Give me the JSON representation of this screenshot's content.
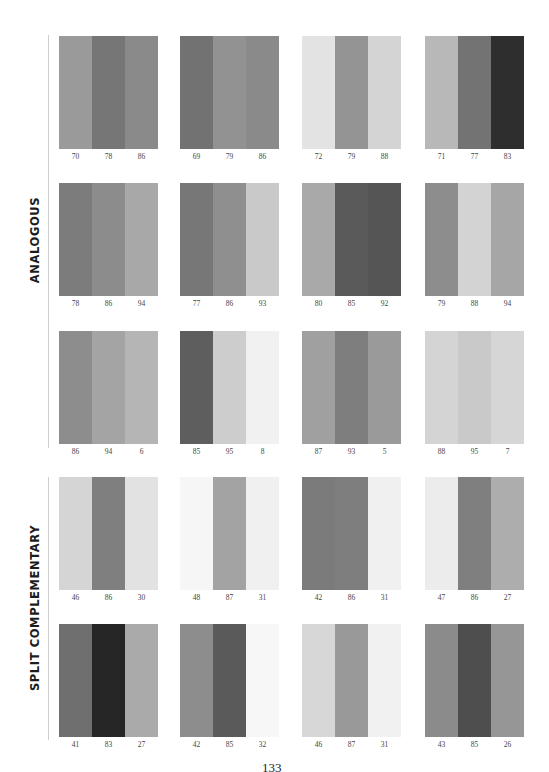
{
  "sections": [
    {
      "label": "ANALOGOUS",
      "line_top": 35,
      "line_height": 413,
      "label_center_y": 240
    },
    {
      "label": "SPLIT COMPLEMENTARY",
      "line_top": 477,
      "line_height": 263,
      "label_center_y": 608
    }
  ],
  "layout": {
    "columns_x": [
      59,
      180,
      302,
      425
    ],
    "rows_y": [
      36,
      183,
      331,
      477,
      624
    ]
  },
  "swatches": [
    {
      "section": "ANALOGOUS",
      "row": 0,
      "col": 0,
      "values": [
        "70",
        "78",
        "86"
      ],
      "colors": [
        "#9a9a9a",
        "#767676",
        "#8a8a8a"
      ]
    },
    {
      "section": "ANALOGOUS",
      "row": 0,
      "col": 1,
      "values": [
        "69",
        "79",
        "86"
      ],
      "colors": [
        "#727272",
        "#929292",
        "#8a8a8a"
      ]
    },
    {
      "section": "ANALOGOUS",
      "row": 0,
      "col": 2,
      "values": [
        "72",
        "79",
        "88"
      ],
      "colors": [
        "#e3e3e3",
        "#949494",
        "#d4d4d4"
      ]
    },
    {
      "section": "ANALOGOUS",
      "row": 0,
      "col": 3,
      "values": [
        "71",
        "77",
        "83"
      ],
      "colors": [
        "#b8b8b8",
        "#737373",
        "#2e2e2e"
      ]
    },
    {
      "section": "ANALOGOUS",
      "row": 1,
      "col": 0,
      "values": [
        "78",
        "86",
        "94"
      ],
      "colors": [
        "#7c7c7c",
        "#8c8c8c",
        "#a8a8a8"
      ]
    },
    {
      "section": "ANALOGOUS",
      "row": 1,
      "col": 1,
      "values": [
        "77",
        "86",
        "93"
      ],
      "colors": [
        "#777777",
        "#8f8f8f",
        "#c9c9c9"
      ]
    },
    {
      "section": "ANALOGOUS",
      "row": 1,
      "col": 2,
      "values": [
        "80",
        "85",
        "92"
      ],
      "colors": [
        "#a9a9a9",
        "#5a5a5a",
        "#555555"
      ]
    },
    {
      "section": "ANALOGOUS",
      "row": 1,
      "col": 3,
      "values": [
        "79",
        "88",
        "94"
      ],
      "colors": [
        "#8d8d8d",
        "#d3d3d3",
        "#a6a6a6"
      ]
    },
    {
      "section": "ANALOGOUS",
      "row": 2,
      "col": 0,
      "values": [
        "86",
        "94",
        "6"
      ],
      "colors": [
        "#8d8d8d",
        "#a4a4a4",
        "#b5b5b5"
      ]
    },
    {
      "section": "ANALOGOUS",
      "row": 2,
      "col": 1,
      "values": [
        "85",
        "95",
        "8"
      ],
      "colors": [
        "#5e5e5e",
        "#cdcdcd",
        "#f1f1f1"
      ]
    },
    {
      "section": "ANALOGOUS",
      "row": 2,
      "col": 2,
      "values": [
        "87",
        "93",
        "5"
      ],
      "colors": [
        "#a0a0a0",
        "#7e7e7e",
        "#9a9a9a"
      ]
    },
    {
      "section": "ANALOGOUS",
      "row": 2,
      "col": 3,
      "values": [
        "88",
        "95",
        "7"
      ],
      "colors": [
        "#d4d4d4",
        "#c9c9c9",
        "#d6d6d6"
      ]
    },
    {
      "section": "SPLIT COMPLEMENTARY",
      "row": 3,
      "col": 0,
      "values": [
        "46",
        "86",
        "30"
      ],
      "colors": [
        "#d5d5d5",
        "#7f7f7f",
        "#e2e2e2"
      ]
    },
    {
      "section": "SPLIT COMPLEMENTARY",
      "row": 3,
      "col": 1,
      "values": [
        "48",
        "87",
        "31"
      ],
      "colors": [
        "#f6f6f6",
        "#a3a3a3",
        "#f0f0f0"
      ]
    },
    {
      "section": "SPLIT COMPLEMENTARY",
      "row": 3,
      "col": 2,
      "values": [
        "42",
        "86",
        "31"
      ],
      "colors": [
        "#7b7b7b",
        "#7e7e7e",
        "#f0f0f0"
      ]
    },
    {
      "section": "SPLIT COMPLEMENTARY",
      "row": 3,
      "col": 3,
      "values": [
        "47",
        "86",
        "27"
      ],
      "colors": [
        "#ececec",
        "#7f7f7f",
        "#adadad"
      ]
    },
    {
      "section": "SPLIT COMPLEMENTARY",
      "row": 4,
      "col": 0,
      "values": [
        "41",
        "83",
        "27"
      ],
      "colors": [
        "#6f6f6f",
        "#262626",
        "#aaaaaa"
      ]
    },
    {
      "section": "SPLIT COMPLEMENTARY",
      "row": 4,
      "col": 1,
      "values": [
        "42",
        "85",
        "32"
      ],
      "colors": [
        "#8d8d8d",
        "#5a5a5a",
        "#f7f7f7"
      ]
    },
    {
      "section": "SPLIT COMPLEMENTARY",
      "row": 4,
      "col": 2,
      "values": [
        "46",
        "87",
        "31"
      ],
      "colors": [
        "#d7d7d7",
        "#999999",
        "#f1f1f1"
      ]
    },
    {
      "section": "SPLIT COMPLEMENTARY",
      "row": 4,
      "col": 3,
      "values": [
        "43",
        "85",
        "26"
      ],
      "colors": [
        "#8b8b8b",
        "#4e4e4e",
        "#969696"
      ]
    }
  ],
  "page_number": "133"
}
